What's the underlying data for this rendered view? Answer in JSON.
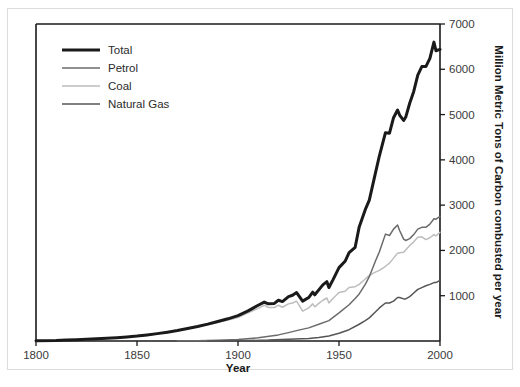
{
  "chart_data": {
    "type": "line",
    "title": "",
    "xlabel": "Year",
    "ylabel": "Million Metric Tons of Carbon combusted per year",
    "xlim": [
      1800,
      2000
    ],
    "ylim": [
      0,
      7000
    ],
    "xticks": [
      1800,
      1850,
      1900,
      1950,
      2000
    ],
    "xticklabels": [
      "1800",
      "1850",
      "1900",
      "1950",
      "2000"
    ],
    "yticks": [
      1000,
      2000,
      3000,
      4000,
      5000,
      6000,
      7000
    ],
    "yticklabels": [
      "1000",
      "2000",
      "3000",
      "4000",
      "5000",
      "6000",
      "7000"
    ],
    "y_axis_side": "right",
    "grid": false,
    "legend_position": "top-left",
    "series": [
      {
        "name": "Total",
        "color": "#1a1a1a",
        "width": 3.0,
        "x": [
          1800,
          1810,
          1815,
          1820,
          1825,
          1830,
          1835,
          1840,
          1845,
          1850,
          1855,
          1860,
          1865,
          1870,
          1875,
          1880,
          1885,
          1890,
          1895,
          1900,
          1905,
          1910,
          1913,
          1915,
          1918,
          1920,
          1922,
          1925,
          1927,
          1929,
          1932,
          1935,
          1937,
          1938,
          1940,
          1942,
          1944,
          1945,
          1947,
          1950,
          1953,
          1955,
          1958,
          1960,
          1963,
          1965,
          1968,
          1970,
          1973,
          1975,
          1977,
          1979,
          1980,
          1982,
          1983,
          1985,
          1987,
          1989,
          1991,
          1993,
          1995,
          1997,
          1998,
          2000
        ],
        "y": [
          8,
          12,
          20,
          28,
          36,
          47,
          58,
          72,
          90,
          110,
          135,
          163,
          195,
          230,
          275,
          320,
          372,
          432,
          490,
          560,
          665,
          790,
          860,
          820,
          830,
          900,
          870,
          980,
          1010,
          1070,
          880,
          960,
          1080,
          1020,
          1130,
          1240,
          1310,
          1180,
          1350,
          1620,
          1760,
          1950,
          2070,
          2520,
          2900,
          3110,
          3700,
          4090,
          4600,
          4590,
          4930,
          5100,
          4990,
          4870,
          4940,
          5250,
          5510,
          5870,
          6060,
          6060,
          6240,
          6600,
          6410,
          6440
        ]
      },
      {
        "name": "Petrol",
        "color": "#6b6b6b",
        "width": 1.5,
        "x": [
          1870,
          1880,
          1890,
          1900,
          1910,
          1920,
          1925,
          1930,
          1935,
          1940,
          1945,
          1950,
          1955,
          1958,
          1960,
          1963,
          1965,
          1968,
          1970,
          1973,
          1975,
          1977,
          1979,
          1980,
          1982,
          1983,
          1985,
          1987,
          1989,
          1991,
          1993,
          1995,
          1997,
          1998,
          2000
        ],
        "y": [
          3,
          8,
          17,
          35,
          70,
          135,
          185,
          240,
          290,
          370,
          450,
          620,
          800,
          940,
          1040,
          1250,
          1420,
          1760,
          1970,
          2360,
          2330,
          2470,
          2560,
          2440,
          2250,
          2220,
          2260,
          2350,
          2470,
          2510,
          2510,
          2580,
          2700,
          2690,
          2750
        ]
      },
      {
        "name": "Coal",
        "color": "#bdbdbd",
        "width": 1.5,
        "x": [
          1800,
          1815,
          1825,
          1835,
          1845,
          1855,
          1865,
          1875,
          1885,
          1895,
          1900,
          1905,
          1910,
          1913,
          1915,
          1918,
          1920,
          1922,
          1925,
          1927,
          1929,
          1932,
          1935,
          1937,
          1938,
          1940,
          1942,
          1944,
          1945,
          1947,
          1950,
          1953,
          1955,
          1958,
          1960,
          1963,
          1965,
          1968,
          1970,
          1973,
          1975,
          1977,
          1979,
          1980,
          1982,
          1985,
          1987,
          1989,
          1991,
          1993,
          1995,
          1997,
          1998,
          2000
        ],
        "y": [
          8,
          18,
          34,
          55,
          87,
          130,
          190,
          268,
          360,
          465,
          520,
          620,
          720,
          790,
          740,
          740,
          790,
          745,
          820,
          840,
          880,
          660,
          730,
          820,
          755,
          830,
          900,
          950,
          840,
          940,
          1070,
          1100,
          1180,
          1200,
          1250,
          1370,
          1450,
          1520,
          1560,
          1650,
          1720,
          1830,
          1940,
          1950,
          1960,
          2110,
          2190,
          2290,
          2300,
          2240,
          2280,
          2350,
          2320,
          2400
        ]
      },
      {
        "name": "Natural Gas",
        "color": "#555555",
        "width": 1.5,
        "x": [
          1885,
          1895,
          1905,
          1915,
          1925,
          1935,
          1940,
          1945,
          1950,
          1955,
          1960,
          1963,
          1965,
          1968,
          1970,
          1973,
          1975,
          1977,
          1979,
          1980,
          1982,
          1983,
          1985,
          1987,
          1989,
          1991,
          1993,
          1995,
          1997,
          1998,
          2000
        ],
        "y": [
          2,
          5,
          11,
          20,
          40,
          55,
          75,
          110,
          170,
          250,
          370,
          450,
          510,
          640,
          730,
          840,
          840,
          880,
          960,
          960,
          930,
          930,
          980,
          1060,
          1140,
          1180,
          1220,
          1250,
          1290,
          1290,
          1340
        ]
      }
    ]
  },
  "legend": {
    "items": [
      {
        "label": "Total"
      },
      {
        "label": "Petrol"
      },
      {
        "label": "Coal"
      },
      {
        "label": "Natural Gas"
      }
    ]
  }
}
